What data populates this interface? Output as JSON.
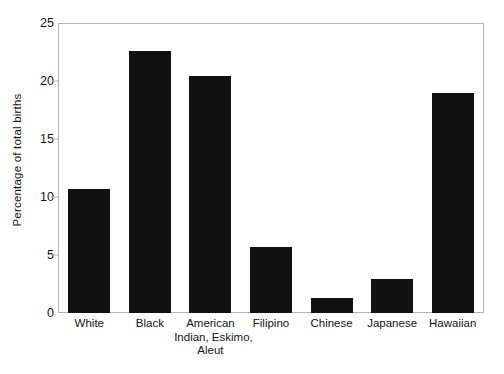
{
  "chart_data": {
    "type": "bar",
    "title": "",
    "subtitle": "",
    "xlabel": "",
    "ylabel": "Percentage of total births",
    "categories": [
      "White",
      "American Indian, Eskimo, Aleut",
      "Black",
      "Filipino",
      "Chinese",
      "Japanese",
      "Hawaiian"
    ],
    "category_lines": [
      [
        "White"
      ],
      [
        "Black"
      ],
      [
        "American",
        "Indian, Eskimo,",
        "Aleut"
      ],
      [
        "Filipino"
      ],
      [
        "Chinese"
      ],
      [
        "Japanese"
      ],
      [
        "Hawaiian"
      ]
    ],
    "bars": [
      {
        "label": "White",
        "value": 10.7
      },
      {
        "label": "Black",
        "value": 22.7
      },
      {
        "label": "American Indian, Eskimo, Aleut",
        "value": 20.5
      },
      {
        "label": "Filipino",
        "value": 5.7
      },
      {
        "label": "Chinese",
        "value": 1.3
      },
      {
        "label": "Japanese",
        "value": 2.9
      },
      {
        "label": "Hawaiian",
        "value": 19.0
      }
    ],
    "values": [
      10.7,
      22.7,
      20.5,
      5.7,
      1.3,
      2.9,
      19.0
    ],
    "ylim": [
      0,
      25
    ],
    "yticks": [
      0,
      5,
      10,
      15,
      20,
      25
    ],
    "ytick_labels": [
      "0",
      "5",
      "10",
      "15",
      "20",
      "25"
    ],
    "grid": false,
    "legend": false,
    "legend_position": "none",
    "bar_color": "#111111",
    "axis_color": "#b3b3b3",
    "text_color": "#151515",
    "background": "#ffffff"
  }
}
